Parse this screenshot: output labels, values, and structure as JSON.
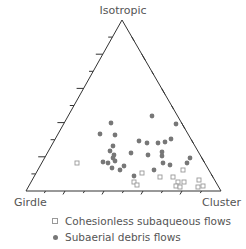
{
  "diagram": {
    "type": "ternary",
    "vertices": {
      "top": "Isotropic",
      "bottom_left": "Girdle",
      "bottom_right": "Cluster"
    },
    "ticks_per_side": 9
  },
  "legend": {
    "items": [
      {
        "label": "Cohesionless subaqueous flows",
        "symbol": "open-square",
        "color": "#999999"
      },
      {
        "label": "Subaerial debris flows",
        "symbol": "filled-circle",
        "color": "#777777"
      }
    ]
  },
  "series": {
    "cohesionless_subaqueous_flows": [
      [
        77,
        163
      ],
      [
        142,
        173
      ],
      [
        183,
        170
      ],
      [
        134,
        182
      ],
      [
        137,
        185
      ],
      [
        160,
        177
      ],
      [
        173,
        177
      ],
      [
        178,
        182
      ],
      [
        184,
        182
      ],
      [
        199,
        180
      ],
      [
        176,
        186
      ],
      [
        180,
        187
      ],
      [
        198,
        187
      ],
      [
        203,
        186
      ]
    ],
    "subaerial_debris_flows": [
      [
        111,
        123
      ],
      [
        152,
        116
      ],
      [
        176,
        124
      ],
      [
        100,
        134
      ],
      [
        115,
        135
      ],
      [
        139,
        141
      ],
      [
        113,
        146
      ],
      [
        158,
        143
      ],
      [
        147,
        143
      ],
      [
        165,
        142
      ],
      [
        162,
        152
      ],
      [
        110,
        151
      ],
      [
        114,
        155
      ],
      [
        131,
        153
      ],
      [
        162,
        156
      ],
      [
        171,
        139
      ],
      [
        108,
        163
      ],
      [
        148,
        155
      ],
      [
        113,
        158
      ],
      [
        115,
        161
      ],
      [
        103,
        162
      ],
      [
        112,
        168
      ],
      [
        120,
        170
      ],
      [
        124,
        166
      ],
      [
        154,
        170
      ],
      [
        163,
        163
      ],
      [
        170,
        165
      ],
      [
        190,
        158
      ],
      [
        187,
        163
      ],
      [
        134,
        176
      ]
    ]
  }
}
